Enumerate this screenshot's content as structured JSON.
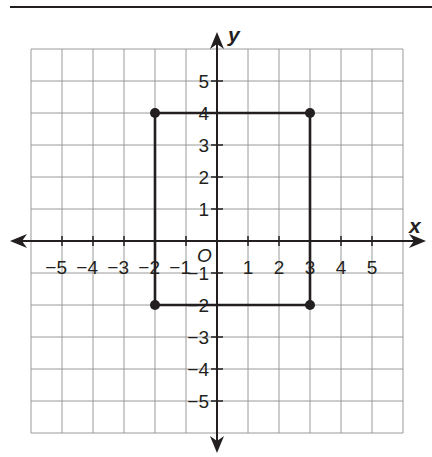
{
  "figure": {
    "header_rule": {
      "x1": 10,
      "x2": 432,
      "y": 7
    },
    "colors": {
      "ink": "#231f20",
      "grid": "#9a9a9a",
      "background": "#ffffff"
    },
    "grid": {
      "left": 31,
      "top": 49,
      "right": 403,
      "bottom": 433,
      "origin_px": {
        "x": 217,
        "y": 241
      },
      "unit_px": {
        "x": 31,
        "y": 32
      }
    },
    "axes": {
      "x_label": "x",
      "y_label": "y",
      "origin_label": "O",
      "x_arrow": {
        "left": 10,
        "right": 426
      },
      "y_arrow": {
        "top": 32,
        "bottom": 453
      }
    }
  },
  "chart_data": {
    "type": "scatter",
    "title": "",
    "xlabel": "x",
    "ylabel": "y",
    "xlim": [
      -6,
      6
    ],
    "ylim": [
      -6,
      6
    ],
    "grid": true,
    "x_tick_labels": [
      "−5",
      "−4",
      "−3",
      "−2",
      "−1",
      "1",
      "2",
      "3",
      "4",
      "5"
    ],
    "y_tick_labels": [
      "5",
      "4",
      "3",
      "2",
      "1",
      "−1",
      "−2",
      "−3",
      "−4",
      "−5"
    ],
    "x_ticks": [
      -5,
      -4,
      -3,
      -2,
      -1,
      1,
      2,
      3,
      4,
      5
    ],
    "y_ticks": [
      5,
      4,
      3,
      2,
      1,
      -1,
      -2,
      -3,
      -4,
      -5
    ],
    "origin_label": "O",
    "series": [
      {
        "name": "rectangle",
        "closed": true,
        "points": [
          {
            "x": -2,
            "y": 4
          },
          {
            "x": 3,
            "y": 4
          },
          {
            "x": 3,
            "y": -2
          },
          {
            "x": -2,
            "y": -2
          }
        ]
      }
    ]
  }
}
